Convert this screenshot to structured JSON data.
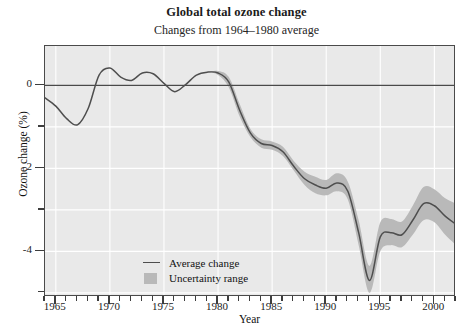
{
  "chart_data": {
    "type": "line",
    "title": "Global total ozone change",
    "subtitle": "Changes from 1964–1980 average",
    "xlabel": "Year",
    "ylabel": "Ozone change (%)",
    "xlim": [
      1964,
      2002
    ],
    "ylim": [
      -5.1,
      0.95
    ],
    "xticks_major": [
      1965,
      1970,
      1975,
      1980,
      1985,
      1990,
      1995,
      2000
    ],
    "xticks_major_labels": [
      "1965",
      "1970",
      "1975",
      "1980",
      "1985",
      "1990",
      "1995",
      "2000"
    ],
    "xtick_minor_step": 1,
    "yticks_major": [
      0,
      -2,
      -4
    ],
    "yticks_major_labels": [
      "0",
      "-2",
      "-4"
    ],
    "yticks_minor": [
      1,
      -1,
      -3,
      -5
    ],
    "grid": "white gridlines at major ticks",
    "zero_line": true,
    "legend_position": "inside lower-left",
    "colors": {
      "plot_background": "#e9e9e9",
      "grid": "#ffffff",
      "line": "#4e4e4e",
      "band": "#b9b9b9",
      "frame": "#4a4a4a",
      "zero_line": "#4a4a4a"
    },
    "legend": [
      {
        "key": "line",
        "label": "Average change"
      },
      {
        "key": "band",
        "label": "Uncertainty range"
      }
    ],
    "series": [
      {
        "name": "Average change",
        "x": [
          1964,
          1965,
          1966,
          1967,
          1968,
          1969,
          1970,
          1971,
          1972,
          1973,
          1974,
          1975,
          1976,
          1977,
          1978,
          1979,
          1980,
          1981,
          1982,
          1983,
          1984,
          1985,
          1986,
          1987,
          1988,
          1989,
          1990,
          1991,
          1992,
          1993,
          1994,
          1995,
          1996,
          1997,
          1998,
          1999,
          2000,
          2001,
          2002
        ],
        "values": [
          -0.3,
          -0.5,
          -0.8,
          -0.95,
          -0.55,
          0.25,
          0.42,
          0.2,
          0.12,
          0.3,
          0.28,
          0.05,
          -0.15,
          0.02,
          0.25,
          0.32,
          0.3,
          0.08,
          -0.6,
          -1.15,
          -1.4,
          -1.45,
          -1.6,
          -1.95,
          -2.25,
          -2.4,
          -2.48,
          -2.35,
          -2.55,
          -3.55,
          -4.7,
          -3.65,
          -3.55,
          -3.6,
          -3.25,
          -2.85,
          -2.9,
          -3.15,
          -3.35
        ],
        "band_upper": [
          -0.3,
          -0.5,
          -0.8,
          -0.95,
          -0.55,
          0.25,
          0.42,
          0.2,
          0.12,
          0.3,
          0.28,
          0.05,
          -0.15,
          0.02,
          0.25,
          0.32,
          0.25,
          -0.05,
          -0.75,
          -1.25,
          -1.5,
          -1.55,
          -1.7,
          -2.05,
          -2.4,
          -2.6,
          -2.65,
          -2.55,
          -2.75,
          -3.85,
          -5.0,
          -4.0,
          -3.85,
          -3.9,
          -3.6,
          -3.25,
          -3.3,
          -3.6,
          -3.85
        ],
        "band_lower": [
          -0.3,
          -0.5,
          -0.8,
          -0.95,
          -0.55,
          0.25,
          0.42,
          0.2,
          0.12,
          0.3,
          0.28,
          0.05,
          -0.15,
          0.02,
          0.25,
          0.32,
          0.35,
          0.2,
          -0.45,
          -1.05,
          -1.3,
          -1.35,
          -1.48,
          -1.82,
          -2.08,
          -2.2,
          -2.28,
          -2.12,
          -2.32,
          -3.25,
          -4.35,
          -3.3,
          -3.22,
          -3.28,
          -2.9,
          -2.45,
          -2.5,
          -2.72,
          -2.85
        ]
      }
    ]
  }
}
